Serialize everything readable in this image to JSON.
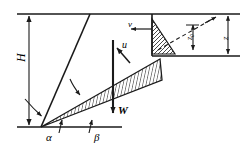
{
  "figure": {
    "type": "engineering-diagram",
    "background": "#ffffff",
    "line_color": "#1a1a1a",
    "hatch_color": "#1a1a1a"
  },
  "main_diagram": {
    "labels": {
      "height": "H",
      "angle_alpha": "α",
      "angle_beta": "β",
      "weight_force": "W",
      "pore_pressure": "u"
    },
    "geometry": {
      "top_ground_line_y": 14,
      "bottom_ground_line_y": 127,
      "apex_x": 41,
      "apex_y": 127,
      "wedge_tip_x": 160,
      "wedge_tip_y": 60
    }
  },
  "inset": {
    "labels": {
      "velocity": "v",
      "depth_z0": "z₀",
      "depth_z": "z"
    },
    "geometry": {
      "box_left": 152,
      "box_right": 238,
      "box_top": 14,
      "box_bottom": 56
    }
  }
}
